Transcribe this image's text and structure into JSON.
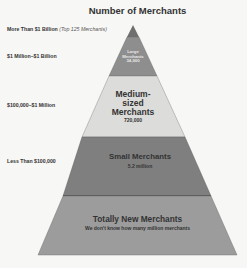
{
  "title": "Number of Merchants",
  "tiers": [
    {
      "range": "More Than $1 Billion",
      "note": "(Top 125 Merchants)"
    },
    {
      "range": "$1 Million–$1 Billion"
    },
    {
      "range": "$100,000–$1 Million"
    },
    {
      "range": "Less Than $100,000"
    }
  ],
  "layers": [
    {
      "name": "Large Merchants",
      "line1": "Large",
      "line2": "Merchants",
      "count": "34,000",
      "color": "#8e8e8e"
    },
    {
      "name": "Medium-sized Merchants",
      "line1": "Medium-",
      "line2": "sized",
      "line3": "Merchants",
      "count": "720,000",
      "color": "#d9d9d7"
    },
    {
      "name": "Small Merchants",
      "count": "5.2 million",
      "color": "#7d7d7d"
    },
    {
      "name": "Totally New Merchants",
      "count": "We don't know how many million merchants",
      "color": "#9a9a9a"
    }
  ],
  "colors": {
    "apex": "#6f6f6f",
    "outline": "#555555",
    "background": "#f7f7f5"
  }
}
